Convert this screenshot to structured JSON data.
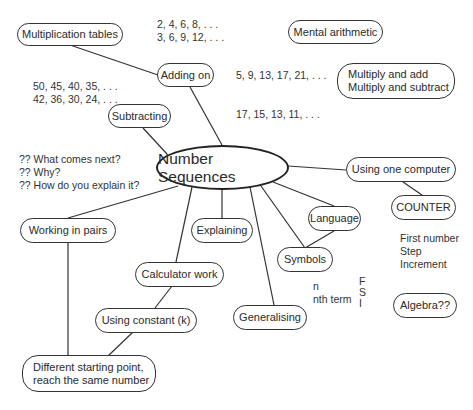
{
  "diagram": {
    "center": {
      "label": "Number Sequences"
    },
    "nodes": {
      "multiplication_tables": "Multiplication tables",
      "adding_on": "Adding on",
      "subtracting": "Subtracting",
      "mental_arithmetic": "Mental arithmetic",
      "multiply_add": [
        "Multiply and add",
        "Multiply and subtract"
      ],
      "using_one_computer": "Using one computer",
      "counter": "COUNTER",
      "working_in_pairs": "Working in pairs",
      "explaining": "Explaining",
      "language": "Language",
      "symbols": "Symbols",
      "calculator_work": "Calculator work",
      "using_constant": "Using constant (k)",
      "generalising": "Generalising",
      "different_starting_point": [
        "Different starting point,",
        "reach the same number"
      ],
      "algebra": "Algebra??"
    },
    "notes": {
      "adding_sequences": [
        "2, 4, 6, 8, . . .",
        "3, 6, 9, 12, . . ."
      ],
      "subtracting_sequences": [
        "50, 45, 40, 35, . . .",
        "42, 36, 30, 24, . . ."
      ],
      "sequence_5_9": "5, 9, 13, 17, 21, . . .",
      "sequence_17_15": "17, 15, 13, 11, . . .",
      "questions": [
        "?? What comes next?",
        "?? Why?",
        "?? How do you explain it?"
      ],
      "counter_params": [
        "First number",
        "Step",
        "Increment"
      ],
      "nth_term": [
        "n",
        "nth term"
      ],
      "fsi": [
        "F",
        "S",
        "I"
      ]
    },
    "edges": [
      [
        "center",
        "adding_on"
      ],
      [
        "adding_on",
        "multiplication_tables"
      ],
      [
        "center",
        "subtracting"
      ],
      [
        "center",
        "using_one_computer"
      ],
      [
        "using_one_computer",
        "counter"
      ],
      [
        "center",
        "working_in_pairs"
      ],
      [
        "working_in_pairs",
        "different_starting_point"
      ],
      [
        "center",
        "explaining"
      ],
      [
        "center",
        "language"
      ],
      [
        "center",
        "symbols"
      ],
      [
        "language",
        "symbols"
      ],
      [
        "center",
        "calculator_work"
      ],
      [
        "calculator_work",
        "using_constant"
      ],
      [
        "using_constant",
        "different_starting_point"
      ],
      [
        "center",
        "generalising"
      ]
    ]
  }
}
